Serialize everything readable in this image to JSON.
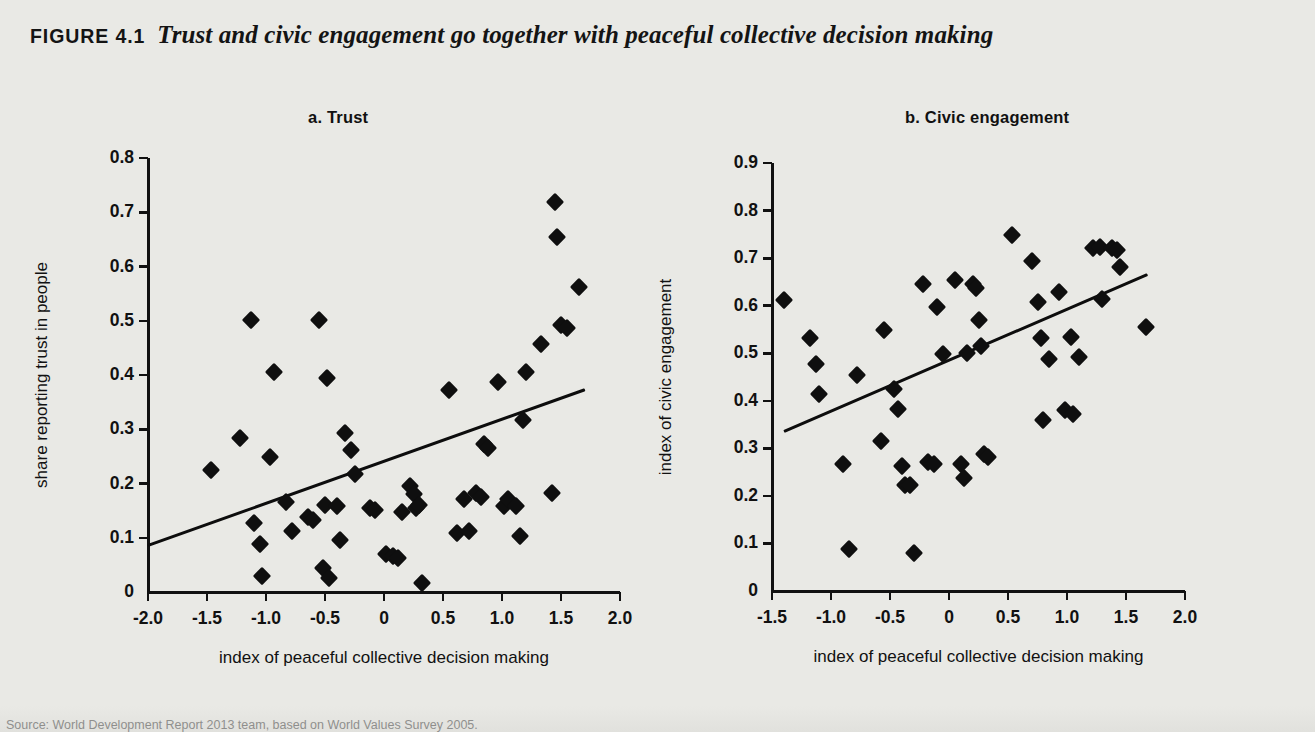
{
  "figure": {
    "number": "FIGURE 4.1",
    "title": "Trust and civic engagement go together with peaceful collective decision making",
    "source": "Source: World Development Report 2013 team, based on World Values Survey 2005."
  },
  "panels": {
    "a": {
      "label": "a.  Trust"
    },
    "b": {
      "label": "b.  Civic engagement"
    }
  },
  "chart_data": [
    {
      "type": "scatter",
      "title": "a.  Trust",
      "xlabel": "index of peaceful collective decision making",
      "ylabel": "share reporting trust in people",
      "xlim": [
        -2.0,
        2.0
      ],
      "ylim": [
        0,
        0.8
      ],
      "xticks": [
        "-2.0",
        "-1.5",
        "-1.0",
        "-0.5",
        "0",
        "0.5",
        "1.0",
        "1.5",
        "2.0"
      ],
      "yticks": [
        "0",
        "0.1",
        "0.2",
        "0.3",
        "0.4",
        "0.5",
        "0.6",
        "0.7",
        "0.8"
      ],
      "grid": false,
      "legend": "none",
      "marker": "diamond",
      "color": "#0f0f0f",
      "points": [
        [
          -1.47,
          0.225
        ],
        [
          -1.22,
          0.283
        ],
        [
          -1.13,
          0.502
        ],
        [
          -1.1,
          0.127
        ],
        [
          -1.05,
          0.089
        ],
        [
          -1.03,
          0.03
        ],
        [
          -0.97,
          0.248
        ],
        [
          -0.93,
          0.405
        ],
        [
          -0.83,
          0.165
        ],
        [
          -0.78,
          0.113
        ],
        [
          -0.64,
          0.138
        ],
        [
          -0.6,
          0.132
        ],
        [
          -0.55,
          0.502
        ],
        [
          -0.52,
          0.045
        ],
        [
          -0.5,
          0.16
        ],
        [
          -0.48,
          0.395
        ],
        [
          -0.47,
          0.025
        ],
        [
          -0.4,
          0.158
        ],
        [
          -0.37,
          0.096
        ],
        [
          -0.33,
          0.293
        ],
        [
          -0.28,
          0.262
        ],
        [
          -0.25,
          0.218
        ],
        [
          -0.12,
          0.155
        ],
        [
          -0.08,
          0.152
        ],
        [
          0.02,
          0.07
        ],
        [
          0.08,
          0.067
        ],
        [
          0.12,
          0.063
        ],
        [
          0.15,
          0.147
        ],
        [
          0.22,
          0.196
        ],
        [
          0.25,
          0.18
        ],
        [
          0.27,
          0.155
        ],
        [
          0.3,
          0.16
        ],
        [
          0.32,
          0.017
        ],
        [
          0.55,
          0.372
        ],
        [
          0.62,
          0.108
        ],
        [
          0.68,
          0.172
        ],
        [
          0.72,
          0.112
        ],
        [
          0.78,
          0.183
        ],
        [
          0.82,
          0.175
        ],
        [
          0.85,
          0.272
        ],
        [
          0.88,
          0.265
        ],
        [
          0.97,
          0.388
        ],
        [
          1.02,
          0.158
        ],
        [
          1.05,
          0.172
        ],
        [
          1.12,
          0.158
        ],
        [
          1.15,
          0.103
        ],
        [
          1.18,
          0.317
        ],
        [
          1.2,
          0.405
        ],
        [
          1.33,
          0.458
        ],
        [
          1.42,
          0.183
        ],
        [
          1.45,
          0.718
        ],
        [
          1.47,
          0.655
        ],
        [
          1.5,
          0.492
        ],
        [
          1.55,
          0.487
        ],
        [
          1.65,
          0.562
        ]
      ],
      "trendline": {
        "x": [
          -2.0,
          1.7
        ],
        "y": [
          0.085,
          0.372
        ]
      }
    },
    {
      "type": "scatter",
      "title": "b.  Civic engagement",
      "xlabel": "index of peaceful collective decision making",
      "ylabel": "index of civic engagement",
      "xlim": [
        -1.5,
        2.0
      ],
      "ylim": [
        0,
        0.9
      ],
      "xticks": [
        "-1.5",
        "-1.0",
        "-0.5",
        "0",
        "0.5",
        "1.0",
        "1.5",
        "2.0"
      ],
      "yticks": [
        "0",
        "0.1",
        "0.2",
        "0.3",
        "0.4",
        "0.5",
        "0.6",
        "0.7",
        "0.8",
        "0.9"
      ],
      "grid": false,
      "legend": "none",
      "marker": "diamond",
      "color": "#0f0f0f",
      "points": [
        [
          -1.4,
          0.612
        ],
        [
          -1.18,
          0.533
        ],
        [
          -1.13,
          0.478
        ],
        [
          -1.1,
          0.415
        ],
        [
          -0.9,
          0.267
        ],
        [
          -0.85,
          0.088
        ],
        [
          -0.78,
          0.455
        ],
        [
          -0.58,
          0.315
        ],
        [
          -0.55,
          0.548
        ],
        [
          -0.47,
          0.425
        ],
        [
          -0.43,
          0.383
        ],
        [
          -0.4,
          0.262
        ],
        [
          -0.37,
          0.222
        ],
        [
          -0.33,
          0.222
        ],
        [
          -0.3,
          0.08
        ],
        [
          -0.22,
          0.645
        ],
        [
          -0.18,
          0.272
        ],
        [
          -0.13,
          0.268
        ],
        [
          -0.1,
          0.597
        ],
        [
          -0.05,
          0.498
        ],
        [
          0.05,
          0.653
        ],
        [
          0.1,
          0.268
        ],
        [
          0.13,
          0.238
        ],
        [
          0.15,
          0.5
        ],
        [
          0.2,
          0.645
        ],
        [
          0.23,
          0.637
        ],
        [
          0.25,
          0.57
        ],
        [
          0.27,
          0.515
        ],
        [
          0.3,
          0.288
        ],
        [
          0.33,
          0.282
        ],
        [
          0.53,
          0.748
        ],
        [
          0.7,
          0.693
        ],
        [
          0.75,
          0.607
        ],
        [
          0.78,
          0.533
        ],
        [
          0.8,
          0.36
        ],
        [
          0.85,
          0.488
        ],
        [
          0.93,
          0.628
        ],
        [
          0.98,
          0.38
        ],
        [
          1.03,
          0.535
        ],
        [
          1.05,
          0.372
        ],
        [
          1.1,
          0.492
        ],
        [
          1.22,
          0.722
        ],
        [
          1.28,
          0.723
        ],
        [
          1.3,
          0.615
        ],
        [
          1.38,
          0.722
        ],
        [
          1.42,
          0.718
        ],
        [
          1.45,
          0.682
        ],
        [
          1.67,
          0.555
        ]
      ],
      "trendline": {
        "x": [
          -1.4,
          1.68
        ],
        "y": [
          0.335,
          0.665
        ]
      }
    }
  ]
}
